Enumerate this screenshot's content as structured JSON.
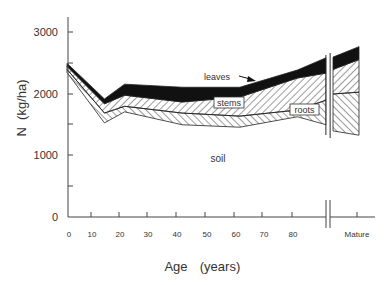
{
  "chart_data": {
    "type": "area",
    "subtype": "stacked",
    "title": "",
    "xlabel": "Age    (years)",
    "ylabel": "N  (kg/ha)",
    "ylim": [
      0,
      3000
    ],
    "yticks": [
      0,
      1000,
      2000,
      3000
    ],
    "yticks_minor": [
      500,
      1500,
      2500
    ],
    "xticks": [
      0,
      10,
      20,
      30,
      40,
      50,
      60,
      70,
      80
    ],
    "xtick_labels": [
      "0",
      "10",
      "20",
      "30",
      "40",
      "50",
      "60",
      "70",
      "80"
    ],
    "x_break_label": "Mature",
    "grid": false,
    "legend": "inline labels",
    "x": [
      0,
      13,
      20,
      40,
      60,
      80,
      90
    ],
    "boundaries": {
      "soil_top": [
        2350,
        1530,
        1710,
        1500,
        1460,
        1630,
        1500
      ],
      "roots_top": [
        2400,
        1690,
        1800,
        1690,
        1640,
        1740,
        1900
      ],
      "stems_top": [
        2450,
        1840,
        1980,
        1870,
        1950,
        2260,
        2340
      ],
      "leaves_top": [
        2500,
        1920,
        2160,
        2110,
        2110,
        2390,
        2590
      ]
    },
    "mature": {
      "soil_top": [
        1400,
        1330
      ],
      "roots_top": [
        2000,
        2030
      ],
      "stems_top": [
        2400,
        2560
      ],
      "leaves_top": [
        2600,
        2770
      ]
    },
    "series": [
      {
        "name": "soil",
        "fill": "white"
      },
      {
        "name": "roots",
        "fill": "hatch-right"
      },
      {
        "name": "stems",
        "fill": "hatch-left"
      },
      {
        "name": "leaves",
        "fill": "black"
      }
    ],
    "annotations": [
      {
        "text": "leaves",
        "arrow": true
      },
      {
        "text": "stems",
        "boxed": true
      },
      {
        "text": "roots",
        "boxed": true
      },
      {
        "text": "soil",
        "boxed": false
      }
    ]
  },
  "labels": {
    "y_axis": "N  (kg/ha)",
    "x_axis_age": "Age",
    "x_axis_unit": "(years)",
    "leaves": "leaves",
    "stems": "stems",
    "roots": "roots",
    "soil": "soil",
    "mature": "Mature",
    "y0": "0",
    "y1000": "1000",
    "y2000": "2000",
    "y3000": "3000",
    "x0": "0",
    "x10": "10",
    "x20": "20",
    "x30": "30",
    "x40": "40",
    "x50": "50",
    "x60": "60",
    "x70": "70",
    "x80": "80"
  }
}
